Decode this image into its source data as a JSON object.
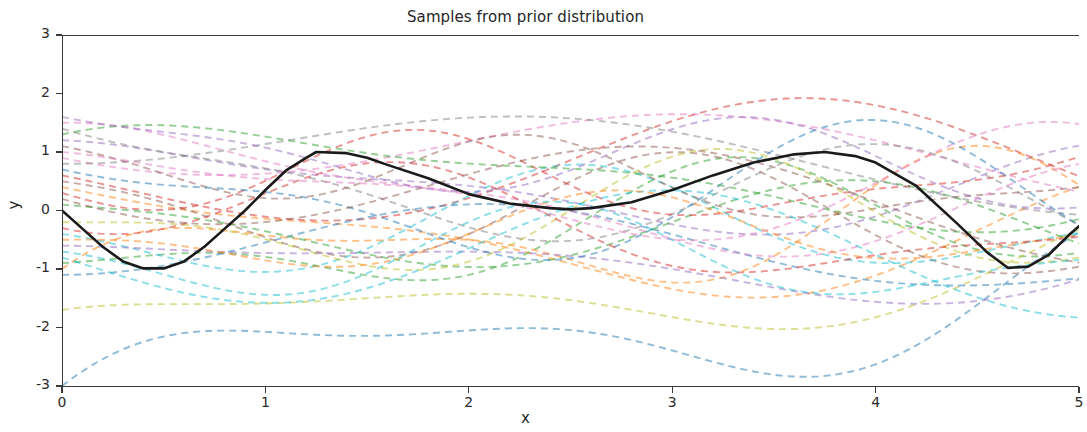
{
  "chart_data": {
    "type": "line",
    "title": "Samples from prior distribution",
    "xlabel": "x",
    "ylabel": "y",
    "xlim": [
      0,
      5
    ],
    "ylim": [
      -3,
      3
    ],
    "xticks": [
      0,
      1,
      2,
      3,
      4,
      5
    ],
    "yticks": [
      3,
      2,
      1,
      0,
      -1,
      -2,
      -3
    ],
    "xticklabels": [
      "0",
      "1",
      "2",
      "3",
      "4",
      "5"
    ],
    "yticklabels": [
      "3",
      "2",
      "1",
      "0",
      "-1",
      "-2",
      "-3"
    ],
    "grid": false,
    "legend": null,
    "n_samples": 28,
    "mean_series": {
      "name": "mean function",
      "style": "solid",
      "color": "#1a1a1a",
      "linewidth": 2.6,
      "points": [
        [
          0.0,
          0.0
        ],
        [
          0.1,
          -0.31
        ],
        [
          0.2,
          -0.62
        ],
        [
          0.3,
          -0.87
        ],
        [
          0.4,
          -0.99
        ],
        [
          0.5,
          -0.99
        ],
        [
          0.6,
          -0.87
        ],
        [
          0.7,
          -0.62
        ],
        [
          0.8,
          -0.31
        ],
        [
          0.9,
          0.0
        ],
        [
          1.0,
          0.35
        ],
        [
          1.1,
          0.68
        ],
        [
          1.2,
          0.9
        ],
        [
          1.25,
          1.0
        ],
        [
          1.4,
          0.98
        ],
        [
          1.5,
          0.9
        ],
        [
          1.6,
          0.78
        ],
        [
          1.8,
          0.55
        ],
        [
          2.0,
          0.28
        ],
        [
          2.2,
          0.12
        ],
        [
          2.4,
          0.04
        ],
        [
          2.5,
          0.02
        ],
        [
          2.6,
          0.04
        ],
        [
          2.8,
          0.14
        ],
        [
          3.0,
          0.35
        ],
        [
          3.2,
          0.6
        ],
        [
          3.4,
          0.82
        ],
        [
          3.6,
          0.96
        ],
        [
          3.75,
          1.0
        ],
        [
          3.9,
          0.93
        ],
        [
          4.0,
          0.82
        ],
        [
          4.2,
          0.42
        ],
        [
          4.4,
          -0.22
        ],
        [
          4.55,
          -0.72
        ],
        [
          4.65,
          -0.98
        ],
        [
          4.75,
          -0.96
        ],
        [
          4.85,
          -0.76
        ],
        [
          4.95,
          -0.42
        ],
        [
          5.0,
          -0.27
        ]
      ]
    },
    "samples": [
      {
        "color": "#1f77b4",
        "amp": 1.8,
        "offset": -1.2,
        "phase": 0.3,
        "freq": 1.1,
        "start": -3.0
      },
      {
        "color": "#ff7f0e",
        "amp": 1.5,
        "offset": -0.6,
        "phase": 1.6,
        "freq": 0.9,
        "start": 0.4
      },
      {
        "color": "#2ca02c",
        "amp": 1.2,
        "offset": 0.3,
        "phase": 2.4,
        "freq": 1.3,
        "start": -0.9
      },
      {
        "color": "#d62728",
        "amp": 1.4,
        "offset": 0.8,
        "phase": 4.1,
        "freq": 0.8,
        "start": 0.6
      },
      {
        "color": "#9467bd",
        "amp": 1.1,
        "offset": 0.2,
        "phase": 0.9,
        "freq": 1.05,
        "start": 1.2
      },
      {
        "color": "#8c564b",
        "amp": 1.3,
        "offset": -0.2,
        "phase": 3.2,
        "freq": 1.2,
        "start": 0.5
      },
      {
        "color": "#e377c2",
        "amp": 1.0,
        "offset": 0.6,
        "phase": 5.0,
        "freq": 0.7,
        "start": 0.9
      },
      {
        "color": "#7f7f7f",
        "amp": 1.25,
        "offset": -0.1,
        "phase": 2.0,
        "freq": 1.15,
        "start": 1.4
      },
      {
        "color": "#bcbd22",
        "amp": 1.35,
        "offset": -0.8,
        "phase": 1.1,
        "freq": 0.95,
        "start": -1.7
      },
      {
        "color": "#17becf",
        "amp": 1.15,
        "offset": 0.0,
        "phase": 3.8,
        "freq": 1.25,
        "start": -0.4
      },
      {
        "color": "#1f77b4",
        "amp": 0.9,
        "offset": -0.7,
        "phase": 5.5,
        "freq": 0.85,
        "start": -1.1
      },
      {
        "color": "#ff7f0e",
        "amp": 1.45,
        "offset": 0.1,
        "phase": 0.2,
        "freq": 1.35,
        "start": -1.0
      },
      {
        "color": "#2ca02c",
        "amp": 1.05,
        "offset": -0.4,
        "phase": 2.9,
        "freq": 1.0,
        "start": 0.1
      },
      {
        "color": "#d62728",
        "amp": 0.95,
        "offset": 0.55,
        "phase": 4.6,
        "freq": 1.45,
        "start": 0.3
      },
      {
        "color": "#9467bd",
        "amp": 1.5,
        "offset": -0.5,
        "phase": 1.4,
        "freq": 0.75,
        "start": -0.6
      },
      {
        "color": "#8c564b",
        "amp": 0.85,
        "offset": 0.35,
        "phase": 3.5,
        "freq": 1.5,
        "start": 1.1
      },
      {
        "color": "#e377c2",
        "amp": 1.2,
        "offset": -0.3,
        "phase": 0.6,
        "freq": 1.1,
        "start": 1.5
      },
      {
        "color": "#7f7f7f",
        "amp": 1.0,
        "offset": 0.45,
        "phase": 5.8,
        "freq": 0.65,
        "start": 0.8
      },
      {
        "color": "#bcbd22",
        "amp": 1.3,
        "offset": 0.15,
        "phase": 2.6,
        "freq": 1.28,
        "start": -0.2
      },
      {
        "color": "#17becf",
        "amp": 1.4,
        "offset": -0.9,
        "phase": 4.3,
        "freq": 0.92,
        "start": -0.8
      },
      {
        "color": "#1f77b4",
        "amp": 1.6,
        "offset": 0.25,
        "phase": 1.9,
        "freq": 1.18,
        "start": 0.7
      },
      {
        "color": "#ff7f0e",
        "amp": 0.8,
        "offset": -0.15,
        "phase": 3.0,
        "freq": 1.4,
        "start": -0.5
      },
      {
        "color": "#2ca02c",
        "amp": 1.45,
        "offset": 0.5,
        "phase": 0.45,
        "freq": 0.88,
        "start": 1.3
      },
      {
        "color": "#d62728",
        "amp": 1.1,
        "offset": -0.55,
        "phase": 5.2,
        "freq": 1.22,
        "start": -0.3
      },
      {
        "color": "#9467bd",
        "amp": 0.95,
        "offset": 0.65,
        "phase": 2.2,
        "freq": 1.32,
        "start": 1.6
      },
      {
        "color": "#8c564b",
        "amp": 1.25,
        "offset": -0.25,
        "phase": 4.9,
        "freq": 0.78,
        "start": 0.2
      },
      {
        "color": "#e377c2",
        "amp": 1.35,
        "offset": 0.4,
        "phase": 1.2,
        "freq": 1.08,
        "start": 1.0
      },
      {
        "color": "#17becf",
        "amp": 1.05,
        "offset": -0.65,
        "phase": 3.6,
        "freq": 1.38,
        "start": -0.7
      }
    ]
  }
}
